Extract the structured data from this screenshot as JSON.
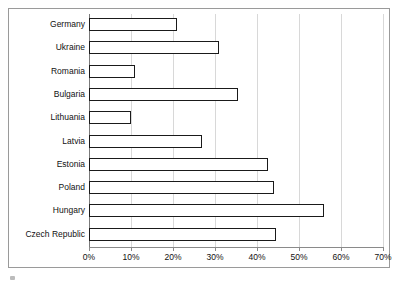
{
  "chart_data": {
    "type": "bar",
    "orientation": "horizontal",
    "title": "",
    "xlabel": "",
    "ylabel": "",
    "categories": [
      "Germany",
      "Ukraine",
      "Romania",
      "Bulgaria",
      "Lithuania",
      "Latvia",
      "Estonia",
      "Poland",
      "Hungary",
      "Czech Republic"
    ],
    "values": [
      21,
      31,
      11,
      35.5,
      10,
      27,
      42.5,
      44,
      56,
      44.5
    ],
    "value_unit": "%",
    "xlim": [
      0,
      70
    ],
    "xticks": [
      0,
      10,
      20,
      30,
      40,
      50,
      60,
      70
    ],
    "xtick_labels": [
      "0%",
      "10%",
      "20%",
      "30%",
      "40%",
      "50%",
      "60%",
      "70%"
    ],
    "grid": true,
    "legend": "none",
    "series": [
      {
        "name": "",
        "values": [
          21,
          31,
          11,
          35.5,
          10,
          27,
          42.5,
          44,
          56,
          44.5
        ]
      }
    ]
  },
  "style": {
    "bar_fill": "#ffffff",
    "bar_stroke": "#1a1a1a",
    "gridline_color": "#d8d8d8",
    "axis_color": "#8a8a8a",
    "frame_color": "#9a9a9a",
    "text_color": "#111111",
    "background": "#ffffff"
  }
}
